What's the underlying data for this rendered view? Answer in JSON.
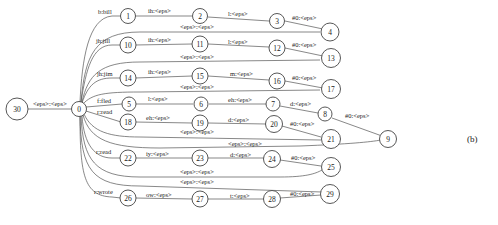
{
  "caption": "(b)",
  "nodes": {
    "n30": "30",
    "n0": "0",
    "n1": "1",
    "n2": "2",
    "n3": "3",
    "n4": "4",
    "n10": "10",
    "n11": "11",
    "n12": "12",
    "n13": "13",
    "n14": "14",
    "n15": "15",
    "n16": "16",
    "n17": "17",
    "n5": "5",
    "n6": "6",
    "n7": "7",
    "n8": "8",
    "n9": "9",
    "n18": "18",
    "n19": "19",
    "n20": "20",
    "n21": "21",
    "n22": "22",
    "n23": "23",
    "n24": "24",
    "n25": "25",
    "n26": "26",
    "n27": "27",
    "n28": "28",
    "n29": "29"
  },
  "edges": {
    "e30_0": "<eps>:<eps>",
    "e0_1": "b:bill",
    "e1_2": "ih:<eps>",
    "e2_3": "l:<eps>",
    "e3_4": "#0:<eps>",
    "e0_4": "<eps>:<eps>",
    "e0_10": "jh:jill",
    "e10_11": "ih:<eps>",
    "e11_12": "l:<eps>",
    "e12_13": "#0:<eps>",
    "e0_13": "<eps>:<eps>",
    "e0_14": "jh:jim",
    "e14_15": "ih:<eps>",
    "e15_16": "m:<eps>",
    "e16_17": "#0:<eps>",
    "e0_17": "<eps>:<eps>",
    "e0_5": "f:fled",
    "e5_6": "l:<eps>",
    "e6_7": "eh:<eps>",
    "e7_8": "d:<eps>",
    "e8_9": "#0:<eps>",
    "e0_18": "r:read",
    "e18_19": "eh:<eps>",
    "e19_20": "d:<eps>",
    "e20_21": "#0:<eps>",
    "e0_21": "<eps>:<eps>",
    "e0_9": "<eps>:<eps>",
    "e0_22": "r:read",
    "e22_23": "iy:<eps>",
    "e23_24": "d:<eps>",
    "e24_25": "#0:<eps>",
    "e0_25": "<eps>:<eps>",
    "e0_29": "<eps>:<eps>",
    "e0_26": "r:wrote",
    "e26_27": "ow:<eps>",
    "e27_28": "t:<eps>",
    "e28_29": "#0:<eps>"
  }
}
